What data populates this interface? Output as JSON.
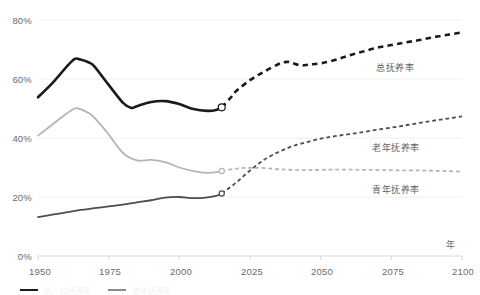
{
  "chart_data": {
    "type": "line",
    "title": "",
    "subtitle": "",
    "xlabel": "年",
    "ylabel": "",
    "xlim": [
      1950,
      2100
    ],
    "ylim": [
      0,
      80
    ],
    "grid": true,
    "legend_position": "inline-right",
    "x_ticks": [
      "1950",
      "1975",
      "2000",
      "2025",
      "2050",
      "2075",
      "2100"
    ],
    "x_tick_values": [
      1950,
      1975,
      2000,
      2025,
      2050,
      2075,
      2100
    ],
    "y_ticks": [
      "0%",
      "20%",
      "40%",
      "60%",
      "80%"
    ],
    "y_tick_values": [
      0,
      20,
      40,
      60,
      80
    ],
    "projection_start_year": 2015,
    "annotations": [
      {
        "text": "总抚养率",
        "x": 2055,
        "y": 62
      },
      {
        "text": "老年抚养率",
        "x": 2055,
        "y": 34
      },
      {
        "text": "青年抚养率",
        "x": 2055,
        "y": 24
      }
    ],
    "series": [
      {
        "name": "总抚养率",
        "color": "#1a1a1a",
        "width": 2.6,
        "x": [
          1950,
          1955,
          1960,
          1963,
          1965,
          1968,
          1970,
          1975,
          1980,
          1983,
          1985,
          1990,
          1995,
          2000,
          2005,
          2010,
          2013,
          2015
        ],
        "values": [
          53.8,
          58.5,
          64.0,
          66.8,
          66.6,
          65.6,
          64.2,
          58.0,
          52.0,
          50.2,
          50.8,
          52.2,
          52.5,
          51.5,
          49.8,
          49.2,
          49.5,
          50.4
        ],
        "x_projected": [
          2015,
          2018,
          2020,
          2025,
          2030,
          2035,
          2038,
          2040,
          2043,
          2046,
          2050,
          2055,
          2060,
          2065,
          2070,
          2075,
          2080,
          2085,
          2090,
          2095,
          2100
        ],
        "values_projected": [
          50.4,
          53.5,
          55.8,
          59.6,
          62.5,
          65.0,
          65.8,
          65.4,
          64.6,
          64.9,
          65.3,
          66.4,
          68.0,
          69.3,
          70.6,
          71.5,
          72.4,
          73.2,
          74.2,
          75.0,
          75.8
        ]
      },
      {
        "name": "老年抚养率",
        "color": "#4d4d4d",
        "width": 1.8,
        "x": [
          1950,
          1955,
          1960,
          1965,
          1970,
          1975,
          1980,
          1985,
          1990,
          1995,
          2000,
          2005,
          2010,
          2013,
          2015
        ],
        "values": [
          13.2,
          14.0,
          14.8,
          15.6,
          16.2,
          16.8,
          17.4,
          18.2,
          18.9,
          19.8,
          20.0,
          19.6,
          19.9,
          20.4,
          21.2
        ],
        "x_projected": [
          2015,
          2020,
          2025,
          2030,
          2035,
          2040,
          2045,
          2050,
          2055,
          2060,
          2065,
          2070,
          2075,
          2080,
          2085,
          2090,
          2095,
          2100
        ],
        "values_projected": [
          21.2,
          24.8,
          29.0,
          32.6,
          35.2,
          37.2,
          38.6,
          39.8,
          40.6,
          41.3,
          42.0,
          42.8,
          43.5,
          44.3,
          45.1,
          45.9,
          46.6,
          47.3
        ]
      },
      {
        "name": "青年抚养率",
        "color": "#b5b5b5",
        "width": 1.8,
        "x": [
          1950,
          1955,
          1960,
          1963,
          1965,
          1968,
          1970,
          1975,
          1980,
          1985,
          1990,
          1995,
          2000,
          2005,
          2010,
          2013,
          2015
        ],
        "values": [
          40.8,
          44.5,
          48.2,
          50.0,
          49.8,
          48.4,
          46.8,
          41.2,
          35.0,
          32.4,
          32.6,
          31.8,
          30.0,
          28.8,
          28.2,
          28.4,
          28.8
        ],
        "x_projected": [
          2015,
          2020,
          2025,
          2030,
          2035,
          2040,
          2045,
          2050,
          2055,
          2060,
          2065,
          2070,
          2075,
          2080,
          2085,
          2090,
          2095,
          2100
        ],
        "values_projected": [
          28.8,
          29.6,
          29.9,
          29.8,
          29.4,
          29.2,
          29.1,
          29.2,
          29.3,
          29.3,
          29.2,
          29.2,
          29.1,
          29.0,
          29.0,
          28.9,
          28.8,
          28.6
        ]
      }
    ]
  },
  "footer_legend": {
    "items": [
      {
        "label": "总人口抚养率"
      },
      {
        "label": "老年抚养率"
      }
    ]
  }
}
